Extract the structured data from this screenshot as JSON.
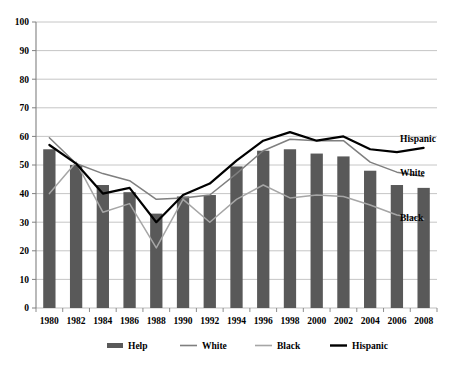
{
  "chart_data": {
    "type": "bar",
    "title": "",
    "subtitle": "",
    "xlabel": "",
    "ylabel": "",
    "ylim": [
      0,
      100
    ],
    "ytick_step": 10,
    "grid": true,
    "legend_position": "bottom",
    "categories": [
      "1980",
      "1982",
      "1984",
      "1986",
      "1988",
      "1990",
      "1992",
      "1994",
      "1996",
      "1998",
      "2000",
      "2002",
      "2004",
      "2006",
      "2008"
    ],
    "yticks": [
      "0",
      "10",
      "20",
      "30",
      "40",
      "50",
      "60",
      "70",
      "80",
      "90",
      "100"
    ],
    "series": [
      {
        "name": "Help",
        "kind": "bar",
        "color": "#595959",
        "values": [
          55.5,
          50.0,
          43.0,
          40.5,
          33.0,
          39.0,
          39.5,
          49.5,
          55.0,
          55.5,
          54.0,
          53.0,
          48.0,
          43.0,
          42.0
        ]
      },
      {
        "name": "White",
        "kind": "line",
        "color": "#7f7f7f",
        "values": [
          59.5,
          50.5,
          47.0,
          44.5,
          38.0,
          38.5,
          39.5,
          47.0,
          55.0,
          59.0,
          58.5,
          58.5,
          51.0,
          47.5,
          46.0
        ]
      },
      {
        "name": "Black",
        "kind": "line",
        "color": "#a6a6a6",
        "values": [
          40.0,
          51.0,
          33.5,
          36.5,
          21.0,
          38.0,
          30.0,
          38.0,
          43.0,
          38.5,
          39.5,
          39.0,
          36.0,
          32.5,
          31.0
        ]
      },
      {
        "name": "Hispanic",
        "kind": "line",
        "color": "#000000",
        "values": [
          57.0,
          50.5,
          40.0,
          42.0,
          30.0,
          39.5,
          43.5,
          51.5,
          58.5,
          61.5,
          58.5,
          60.0,
          55.5,
          54.5,
          56.0
        ]
      }
    ],
    "inline_labels": [
      {
        "text": "Hispanic",
        "series": "Hispanic"
      },
      {
        "text": "White",
        "series": "White"
      },
      {
        "text": "Black",
        "series": "Black"
      }
    ],
    "legend": [
      {
        "label": "Help",
        "color": "#595959",
        "kind": "bar"
      },
      {
        "label": "White",
        "color": "#7f7f7f",
        "kind": "line"
      },
      {
        "label": "Black",
        "color": "#a6a6a6",
        "kind": "line"
      },
      {
        "label": "Hispanic",
        "color": "#000000",
        "kind": "line"
      }
    ],
    "colors": {
      "grid": "#bfbfbf",
      "axis": "#808080",
      "background": "#ffffff"
    }
  }
}
